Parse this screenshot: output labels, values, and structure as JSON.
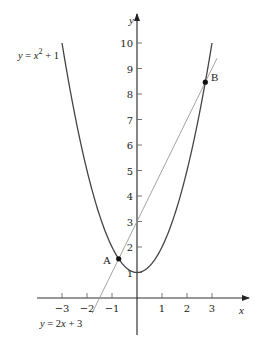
{
  "chart_data": {
    "type": "line",
    "title": "",
    "xlabel": "x",
    "ylabel": "y",
    "xlim": [
      -4,
      4
    ],
    "ylim": [
      -1.5,
      11
    ],
    "grid": false,
    "x_ticks": [
      -3,
      -2,
      -1,
      1,
      2,
      3
    ],
    "y_ticks": [
      1,
      2,
      3,
      4,
      5,
      6,
      7,
      8,
      9,
      10
    ],
    "series": [
      {
        "name": "y = x^2 + 1",
        "label_text": "y = x² + 1",
        "kind": "parabola",
        "a": 1,
        "b": 0,
        "c": 1,
        "x_range": [
          -3,
          3
        ]
      },
      {
        "name": "y = 2x + 3",
        "label_text": "y = 2x + 3",
        "kind": "line",
        "slope": 2,
        "intercept": 3,
        "x_range": [
          -1.8,
          3.2
        ]
      }
    ],
    "points": [
      {
        "label": "A",
        "x": -0.732,
        "y": 1.536
      },
      {
        "label": "B",
        "x": 2.732,
        "y": 8.464
      }
    ]
  },
  "axes": {
    "x_label": "x",
    "y_label": "y",
    "x_tick_labels": [
      "−3",
      "−2",
      "−1",
      "1",
      "2",
      "3"
    ],
    "y_tick_labels": [
      "1",
      "2",
      "3",
      "4",
      "5",
      "6",
      "7",
      "8",
      "9",
      "10"
    ]
  },
  "labels": {
    "parabola": {
      "lhs": "y",
      "eq": " = ",
      "base": "x",
      "exp": "2",
      "rest": " + 1"
    },
    "line": {
      "lhs": "y",
      "eq": " = 2",
      "var": "x",
      "rest": " + 3"
    },
    "point_a": "A",
    "point_b": "B"
  },
  "colors": {
    "axis": "#333333",
    "parabola": "#444444",
    "line": "#999999",
    "point": "#111111"
  }
}
